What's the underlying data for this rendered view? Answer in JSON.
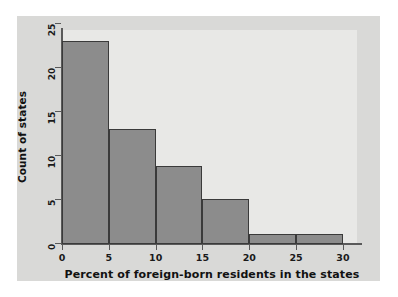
{
  "chart_data": {
    "type": "bar",
    "title": "",
    "subtitle": "",
    "xlabel": "Percent of foreign-born residents in the states",
    "ylabel": "Count of states",
    "categories": [
      "0-5",
      "5-10",
      "10-15",
      "15-20",
      "20-25",
      "25-30"
    ],
    "bin_edges": [
      0,
      5,
      10,
      15,
      20,
      25,
      30
    ],
    "values": [
      23,
      13,
      8.7,
      5,
      1,
      1
    ],
    "xlim": [
      0,
      31.5
    ],
    "ylim": [
      0,
      25.5
    ],
    "xticks": [
      "0",
      "5",
      "10",
      "15",
      "20",
      "25",
      "30"
    ],
    "xtick_values": [
      0,
      5,
      10,
      15,
      20,
      25,
      30
    ],
    "yticks": [
      "0",
      "5",
      "10",
      "15",
      "20",
      "25"
    ],
    "ytick_values": [
      0,
      5,
      10,
      15,
      20,
      25
    ],
    "grid": false,
    "legend": null,
    "annotations": [],
    "colors": {
      "bar_fill": "#8c8c8c",
      "bar_edge": "#3a3a3a",
      "plot_background": "#e8e8e6",
      "card_background": "#d9d9d7",
      "axis": "#5a5a5a",
      "text": "#111111"
    }
  }
}
